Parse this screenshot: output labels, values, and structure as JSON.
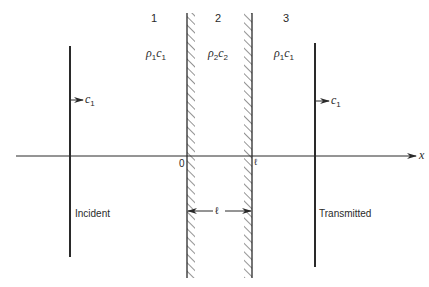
{
  "diagram": {
    "title": "",
    "regions": [
      {
        "number": "1",
        "medium": {
          "rho": "ρ",
          "rho_sub": "1",
          "c": "c",
          "c_sub": "1"
        }
      },
      {
        "number": "2",
        "medium": {
          "rho": "ρ",
          "rho_sub": "2",
          "c": "c",
          "c_sub": "2"
        }
      },
      {
        "number": "3",
        "medium": {
          "rho": "ρ",
          "rho_sub": "1",
          "c": "c",
          "c_sub": "1"
        }
      }
    ],
    "incident_wave": {
      "label": "Incident",
      "speed": "c",
      "speed_sub": "1"
    },
    "transmitted_wave": {
      "label": "Transmitted",
      "speed": "c",
      "speed_sub": "1"
    },
    "axis": {
      "label": "x",
      "origin_label": "0",
      "end_label": "ℓ"
    },
    "dimension": {
      "label": "ℓ"
    },
    "colors": {
      "ink": "#2a2a2a",
      "background": "#ffffff"
    }
  }
}
